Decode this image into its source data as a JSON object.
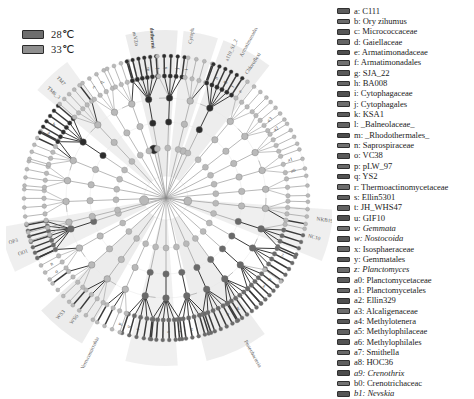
{
  "figure": {
    "type": "lefse-cladogram",
    "background": "#ffffff"
  },
  "group_legend": {
    "items": [
      {
        "label": "28℃",
        "color": "#6e6e6e",
        "border": "#2b2b2b"
      },
      {
        "label": "33℃",
        "color": "#8f8f8f",
        "border": "#2b2b2b"
      }
    ]
  },
  "palette": {
    "node_neutral": "#b9b9b9",
    "node_group1": "#6a6a6a",
    "node_group2": "#2c2c2c",
    "branch": "#9a9a9a",
    "branch_dark": "#3a3a3a",
    "wedge": "#d8d8d8",
    "label_text": "#3c3c3c"
  },
  "taxon_legend": {
    "items": [
      {
        "key": "a",
        "name": "C111",
        "italic": false,
        "color": "#5d5d5d"
      },
      {
        "key": "b",
        "name": "Ory zihumus",
        "italic": false,
        "color": "#6b6b6b"
      },
      {
        "key": "c",
        "name": "Micrococcaceae",
        "italic": false,
        "color": "#565656"
      },
      {
        "key": "d",
        "name": "Gaiellaceae",
        "italic": false,
        "color": "#646464"
      },
      {
        "key": "e",
        "name": "Armatimonadaceae",
        "italic": false,
        "color": "#4f4f4f"
      },
      {
        "key": "f",
        "name": "Armatimonadales",
        "italic": false,
        "color": "#717171"
      },
      {
        "key": "g",
        "name": "SJA_22",
        "italic": false,
        "color": "#5a5a5a"
      },
      {
        "key": "h",
        "name": "BA008",
        "italic": false,
        "color": "#676767"
      },
      {
        "key": "i",
        "name": "Cytophagaceae",
        "italic": false,
        "color": "#515151"
      },
      {
        "key": "j",
        "name": "Cytophagales",
        "italic": false,
        "color": "#6e6e6e"
      },
      {
        "key": "k",
        "name": "KSA1",
        "italic": false,
        "color": "#5c5c5c"
      },
      {
        "key": "l",
        "name": "_Balneolaceae_",
        "italic": false,
        "color": "#636363"
      },
      {
        "key": "m",
        "name": "_Rhodothermales_",
        "italic": false,
        "color": "#4d4d4d"
      },
      {
        "key": "n",
        "name": "Saprospiraceae",
        "italic": false,
        "color": "#707070"
      },
      {
        "key": "o",
        "name": "VC38",
        "italic": false,
        "color": "#595959"
      },
      {
        "key": "p",
        "name": "pLW_97",
        "italic": false,
        "color": "#686868"
      },
      {
        "key": "q",
        "name": "YS2",
        "italic": false,
        "color": "#525252"
      },
      {
        "key": "r",
        "name": "Thermoactinomycetaceae",
        "italic": false,
        "color": "#6c6c6c"
      },
      {
        "key": "s",
        "name": "Ellin5301",
        "italic": false,
        "color": "#5e5e5e"
      },
      {
        "key": "t",
        "name": "JH_WHS47",
        "italic": false,
        "color": "#626262"
      },
      {
        "key": "u",
        "name": "GIF10",
        "italic": false,
        "color": "#505050"
      },
      {
        "key": "v",
        "name": "Gemmata",
        "italic": true,
        "color": "#6f6f6f"
      },
      {
        "key": "w",
        "name": "Nostocoida",
        "italic": true,
        "color": "#575757"
      },
      {
        "key": "x",
        "name": "Isosphaeraceae",
        "italic": false,
        "color": "#666666"
      },
      {
        "key": "y",
        "name": "Gemmatales",
        "italic": false,
        "color": "#545454"
      },
      {
        "key": "z",
        "name": "Planctomyces",
        "italic": true,
        "color": "#6a6a6a"
      },
      {
        "key": "a0",
        "name": "Planctomycetaceae",
        "italic": false,
        "color": "#5b5b5b"
      },
      {
        "key": "a1",
        "name": "Planctomycetales",
        "italic": false,
        "color": "#656565"
      },
      {
        "key": "a2",
        "name": "Ellin329",
        "italic": false,
        "color": "#4e4e4e"
      },
      {
        "key": "a3",
        "name": "Alcaligenaceae",
        "italic": false,
        "color": "#6d6d6d"
      },
      {
        "key": "a4",
        "name": "Methylotenera",
        "italic": false,
        "color": "#585858"
      },
      {
        "key": "a5",
        "name": "Methylophilaceae",
        "italic": false,
        "color": "#616161"
      },
      {
        "key": "a6",
        "name": "Methylophilales",
        "italic": false,
        "color": "#535353"
      },
      {
        "key": "a7",
        "name": "Smithella",
        "italic": false,
        "color": "#696969"
      },
      {
        "key": "a8",
        "name": "HOC36",
        "italic": false,
        "color": "#5f5f5f"
      },
      {
        "key": "a9",
        "name": "Crenothrix",
        "italic": true,
        "color": "#4c4c4c"
      },
      {
        "key": "b0",
        "name": "Crenotrichaceac",
        "italic": false,
        "color": "#727272"
      },
      {
        "key": "b1",
        "name": "Nevskia",
        "italic": true,
        "color": "#555555"
      }
    ]
  },
  "cladogram": {
    "center": {
      "x": 160,
      "y": 170
    },
    "ring_radii": [
      22,
      50,
      76,
      100,
      122,
      142
    ],
    "root_dot": {
      "x": 160,
      "y": 170,
      "r": 1.4,
      "color": "#8a8a8a"
    },
    "hub_nodes": [
      {
        "angle": 186,
        "radius": 22,
        "r": 4.6,
        "state": "neutral"
      },
      {
        "angle": 352,
        "radius": 22,
        "r": 4.0,
        "state": "neutral"
      },
      {
        "angle": 104,
        "radius": 50,
        "r": 4.4,
        "state": "group2"
      },
      {
        "angle": 70,
        "radius": 50,
        "r": 3.4,
        "state": "neutral"
      }
    ],
    "outer_labels": [
      {
        "text": "nsVZn",
        "angle": 101,
        "radius": 155,
        "bold": false
      },
      {
        "text": "Rhodothermi",
        "angle": 95,
        "radius": 150,
        "bold": true
      },
      {
        "text": "Cytophagia",
        "angle": 81,
        "radius": 156,
        "bold": false
      },
      {
        "text": "Armatimonadetes",
        "angle": 62,
        "radius": 160,
        "bold": false
      },
      {
        "text": "Chloroflexi",
        "angle": 57,
        "radius": 148,
        "bold": false
      },
      {
        "text": "a119_SJ_2",
        "angle": 66,
        "radius": 150,
        "bold": false
      },
      {
        "text": "TM7",
        "angle": 132,
        "radius": 152,
        "bold": false
      },
      {
        "text": "TM6_3",
        "angle": 137,
        "radius": 146,
        "bold": false
      },
      {
        "text": "OP3",
        "angle": 196,
        "radius": 154,
        "bold": false
      },
      {
        "text": "OD1",
        "angle": 201,
        "radius": 148,
        "bold": false
      },
      {
        "text": "WS3",
        "angle": 228,
        "radius": 152,
        "bold": false
      },
      {
        "text": "WS6",
        "angle": 233,
        "radius": 147,
        "bold": false
      },
      {
        "text": "Verrucomicrobia",
        "angle": 244,
        "radius": 155,
        "bold": false
      },
      {
        "text": "Proteobacteria",
        "angle": 299,
        "radius": 163,
        "bold": false
      },
      {
        "text": "NKB19",
        "angle": 352,
        "radius": 152,
        "bold": false
      },
      {
        "text": "NC10",
        "angle": 345,
        "radius": 147,
        "bold": false
      }
    ],
    "ring_tick_labels": [
      {
        "text": "m",
        "angle": 98,
        "radius": 130
      },
      {
        "text": "l",
        "angle": 94,
        "radius": 130
      },
      {
        "text": "k",
        "angle": 90,
        "radius": 130
      },
      {
        "text": "j",
        "angle": 85,
        "radius": 130
      },
      {
        "text": "i",
        "angle": 81,
        "radius": 130
      },
      {
        "text": "h",
        "angle": 67,
        "radius": 130
      },
      {
        "text": "g",
        "angle": 63,
        "radius": 130
      },
      {
        "text": "f",
        "angle": 59,
        "radius": 130
      },
      {
        "text": "e",
        "angle": 55,
        "radius": 130
      },
      {
        "text": "d",
        "angle": 119,
        "radius": 132
      },
      {
        "text": "c",
        "angle": 123,
        "radius": 132
      },
      {
        "text": "b",
        "angle": 147,
        "radius": 134
      },
      {
        "text": "a",
        "angle": 151,
        "radius": 134
      },
      {
        "text": "n",
        "angle": 210,
        "radius": 132
      },
      {
        "text": "o",
        "angle": 214,
        "radius": 132
      },
      {
        "text": "p",
        "angle": 250,
        "radius": 134
      },
      {
        "text": "q",
        "angle": 254,
        "radius": 134
      },
      {
        "text": "r",
        "angle": 258,
        "radius": 134
      },
      {
        "text": "s",
        "angle": 271,
        "radius": 134
      },
      {
        "text": "t",
        "angle": 276,
        "radius": 134
      },
      {
        "text": "u",
        "angle": 281,
        "radius": 134
      },
      {
        "text": "v",
        "angle": 298,
        "radius": 132
      },
      {
        "text": "w",
        "angle": 303,
        "radius": 132
      },
      {
        "text": "x",
        "angle": 318,
        "radius": 132
      },
      {
        "text": "y",
        "angle": 322,
        "radius": 132
      },
      {
        "text": "z",
        "angle": 334,
        "radius": 130
      },
      {
        "text": "a0",
        "angle": 12,
        "radius": 130
      },
      {
        "text": "a1",
        "angle": 17,
        "radius": 130
      },
      {
        "text": "a2",
        "angle": 32,
        "radius": 130
      },
      {
        "text": "a3",
        "angle": 37,
        "radius": 130
      }
    ],
    "wedges": [
      {
        "start": 86,
        "end": 104,
        "color": "#dcdcdc"
      },
      {
        "start": 72,
        "end": 84,
        "color": "#e0e0e0"
      },
      {
        "start": 52,
        "end": 70,
        "color": "#dedede"
      },
      {
        "start": 126,
        "end": 140,
        "color": "#e2e2e2"
      },
      {
        "start": 190,
        "end": 206,
        "color": "#e1e1e1"
      },
      {
        "start": 222,
        "end": 240,
        "color": "#dddddd"
      },
      {
        "start": 284,
        "end": 306,
        "color": "#dfdfdf"
      },
      {
        "start": 338,
        "end": 356,
        "color": "#e1e1e1"
      },
      {
        "start": 256,
        "end": 274,
        "color": "#e3e3e3"
      }
    ],
    "clades": [
      {
        "angle": 182,
        "state": "neutral",
        "leaves": 4,
        "spread": 11,
        "depth": 3,
        "dark_leaves": 0
      },
      {
        "angle": 170,
        "state": "neutral",
        "leaves": 4,
        "spread": 10,
        "depth": 3,
        "dark_leaves": 0
      },
      {
        "angle": 158,
        "state": "neutral",
        "leaves": 5,
        "spread": 12,
        "depth": 3,
        "dark_leaves": 2
      },
      {
        "angle": 146,
        "state": "group2",
        "leaves": 6,
        "spread": 13,
        "depth": 4,
        "dark_leaves": 6
      },
      {
        "angle": 133,
        "state": "neutral",
        "leaves": 5,
        "spread": 11,
        "depth": 3,
        "dark_leaves": 1
      },
      {
        "angle": 121,
        "state": "neutral",
        "leaves": 4,
        "spread": 10,
        "depth": 3,
        "dark_leaves": 0
      },
      {
        "angle": 110,
        "state": "neutral",
        "leaves": 4,
        "spread": 9,
        "depth": 3,
        "dark_leaves": 1
      },
      {
        "angle": 100,
        "state": "group2",
        "leaves": 6,
        "spread": 12,
        "depth": 4,
        "dark_leaves": 6
      },
      {
        "angle": 88,
        "state": "group2",
        "leaves": 5,
        "spread": 11,
        "depth": 4,
        "dark_leaves": 4
      },
      {
        "angle": 76,
        "state": "neutral",
        "leaves": 4,
        "spread": 10,
        "depth": 3,
        "dark_leaves": 1
      },
      {
        "angle": 64,
        "state": "group2",
        "leaves": 6,
        "spread": 13,
        "depth": 4,
        "dark_leaves": 6
      },
      {
        "angle": 50,
        "state": "neutral",
        "leaves": 4,
        "spread": 10,
        "depth": 3,
        "dark_leaves": 0
      },
      {
        "angle": 38,
        "state": "neutral",
        "leaves": 4,
        "spread": 9,
        "depth": 3,
        "dark_leaves": 0
      },
      {
        "angle": 27,
        "state": "neutral",
        "leaves": 4,
        "spread": 9,
        "depth": 3,
        "dark_leaves": 0
      },
      {
        "angle": 16,
        "state": "neutral",
        "leaves": 3,
        "spread": 8,
        "depth": 3,
        "dark_leaves": 0
      },
      {
        "angle": 5,
        "state": "neutral",
        "leaves": 3,
        "spread": 8,
        "depth": 3,
        "dark_leaves": 0
      },
      {
        "angle": 354,
        "state": "neutral",
        "leaves": 4,
        "spread": 9,
        "depth": 3,
        "dark_leaves": 1
      },
      {
        "angle": 342,
        "state": "group1",
        "leaves": 5,
        "spread": 11,
        "depth": 4,
        "dark_leaves": 4
      },
      {
        "angle": 330,
        "state": "group1",
        "leaves": 5,
        "spread": 11,
        "depth": 4,
        "dark_leaves": 5
      },
      {
        "angle": 318,
        "state": "group1",
        "leaves": 6,
        "spread": 12,
        "depth": 4,
        "dark_leaves": 5
      },
      {
        "angle": 306,
        "state": "group1",
        "leaves": 6,
        "spread": 12,
        "depth": 4,
        "dark_leaves": 6
      },
      {
        "angle": 294,
        "state": "group1",
        "leaves": 6,
        "spread": 13,
        "depth": 4,
        "dark_leaves": 6
      },
      {
        "angle": 282,
        "state": "group1",
        "leaves": 6,
        "spread": 13,
        "depth": 4,
        "dark_leaves": 6
      },
      {
        "angle": 270,
        "state": "group1",
        "leaves": 6,
        "spread": 13,
        "depth": 4,
        "dark_leaves": 6
      },
      {
        "angle": 258,
        "state": "group1",
        "leaves": 5,
        "spread": 12,
        "depth": 4,
        "dark_leaves": 5
      },
      {
        "angle": 246,
        "state": "neutral",
        "leaves": 4,
        "spread": 10,
        "depth": 3,
        "dark_leaves": 2
      },
      {
        "angle": 234,
        "state": "neutral",
        "leaves": 4,
        "spread": 10,
        "depth": 3,
        "dark_leaves": 2
      },
      {
        "angle": 222,
        "state": "neutral",
        "leaves": 4,
        "spread": 10,
        "depth": 3,
        "dark_leaves": 1
      },
      {
        "angle": 210,
        "state": "neutral",
        "leaves": 4,
        "spread": 10,
        "depth": 3,
        "dark_leaves": 1
      },
      {
        "angle": 198,
        "state": "group1",
        "leaves": 7,
        "spread": 14,
        "depth": 4,
        "dark_leaves": 7
      },
      {
        "angle": 194,
        "state": "neutral",
        "leaves": 3,
        "spread": 7,
        "depth": 3,
        "dark_leaves": 0
      }
    ]
  }
}
